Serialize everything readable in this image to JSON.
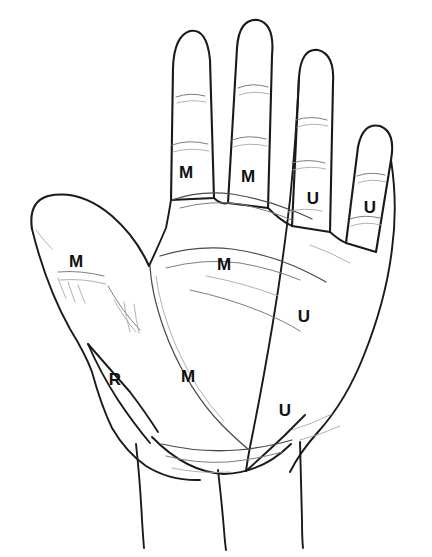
{
  "figure": {
    "type": "anatomical-line-drawing",
    "background_color": "#ffffff",
    "line_color": "#1a1a1a",
    "label_color": "#111111"
  },
  "legend_meaning": {
    "M": "Median nerve",
    "U": "Ulnar nerve",
    "R": "Radial nerve"
  },
  "labels": [
    {
      "id": "thumb-m",
      "text": "M",
      "region": "thumb",
      "x": 76,
      "y": 261
    },
    {
      "id": "index-m",
      "text": "M",
      "region": "index-finger",
      "x": 186,
      "y": 172
    },
    {
      "id": "middle-m",
      "text": "M",
      "region": "middle-finger",
      "x": 248,
      "y": 176
    },
    {
      "id": "ring-u",
      "text": "U",
      "region": "ring-finger",
      "x": 313,
      "y": 198
    },
    {
      "id": "little-u",
      "text": "U",
      "region": "little-finger",
      "x": 370,
      "y": 207
    },
    {
      "id": "palm-upper-m",
      "text": "M",
      "region": "mid-palm",
      "x": 224,
      "y": 264
    },
    {
      "id": "palm-lower-m",
      "text": "M",
      "region": "thenar-palm",
      "x": 188,
      "y": 376
    },
    {
      "id": "hypothenar-u1",
      "text": "U",
      "region": "hypothenar-upper",
      "x": 304,
      "y": 316
    },
    {
      "id": "hypothenar-u2",
      "text": "U",
      "region": "hypothenar-lower",
      "x": 285,
      "y": 410
    },
    {
      "id": "radial-r",
      "text": "R",
      "region": "radial-border",
      "x": 115,
      "y": 379
    }
  ],
  "label_counts": {
    "median_M": 5,
    "ulnar_U": 4,
    "radial_R": 1
  }
}
